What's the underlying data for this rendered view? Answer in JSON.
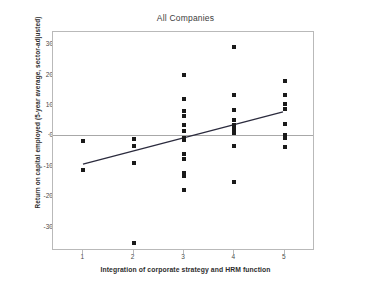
{
  "chart_data": {
    "type": "scatter",
    "title": "All Companies",
    "xlabel": "Integration of corporate strategy and HRM function",
    "ylabel": "Return on capital employed (5-year average, sector-adjusted)",
    "xlim": [
      0.4,
      5.6
    ],
    "ylim": [
      -38,
      34
    ],
    "xticks": [
      1,
      2,
      3,
      4,
      5
    ],
    "xticklabels": [
      "1",
      "2",
      "3",
      "4",
      "5"
    ],
    "yticks": [
      30,
      20,
      10,
      0,
      -10,
      -20,
      -30
    ],
    "yticklabels": [
      "30",
      "20",
      "10",
      "0",
      "-10",
      "-20",
      "-30"
    ],
    "grid": false,
    "legend": null,
    "zero_reference_line": 0,
    "marker": "square",
    "marker_color": "#1a1a1a",
    "points": [
      {
        "x": 1,
        "y": -1.8
      },
      {
        "x": 1,
        "y": -11.3
      },
      {
        "x": 2,
        "y": -1.2
      },
      {
        "x": 2,
        "y": -3.5
      },
      {
        "x": 2,
        "y": -9.0
      },
      {
        "x": 2,
        "y": -35.2
      },
      {
        "x": 3,
        "y": 19.8
      },
      {
        "x": 3,
        "y": 12.0
      },
      {
        "x": 3,
        "y": 8.0
      },
      {
        "x": 3,
        "y": 6.3
      },
      {
        "x": 3,
        "y": 3.3
      },
      {
        "x": 3,
        "y": 1.6
      },
      {
        "x": 3,
        "y": -0.8
      },
      {
        "x": 3,
        "y": -1.6
      },
      {
        "x": 3,
        "y": -6.0
      },
      {
        "x": 3,
        "y": -7.8
      },
      {
        "x": 3,
        "y": -12.2
      },
      {
        "x": 3,
        "y": -13.3
      },
      {
        "x": 3,
        "y": -17.8
      },
      {
        "x": 4,
        "y": 29.0
      },
      {
        "x": 4,
        "y": 13.2
      },
      {
        "x": 4,
        "y": 8.4
      },
      {
        "x": 4,
        "y": 5.0
      },
      {
        "x": 4,
        "y": 3.4
      },
      {
        "x": 4,
        "y": 2.2
      },
      {
        "x": 4,
        "y": 0.8
      },
      {
        "x": 4,
        "y": -3.6
      },
      {
        "x": 4,
        "y": -15.2
      },
      {
        "x": 5,
        "y": 17.8
      },
      {
        "x": 5,
        "y": 13.3
      },
      {
        "x": 5,
        "y": 10.2
      },
      {
        "x": 5,
        "y": 8.8
      },
      {
        "x": 5,
        "y": 3.8
      },
      {
        "x": 5,
        "y": 0.3
      },
      {
        "x": 5,
        "y": -0.8
      },
      {
        "x": 5,
        "y": -3.8
      }
    ],
    "trend_line": {
      "x_start": 1.0,
      "y_start": -9.8,
      "x_end": 5.0,
      "y_end": 7.5,
      "color": "#2b2b3d"
    }
  }
}
